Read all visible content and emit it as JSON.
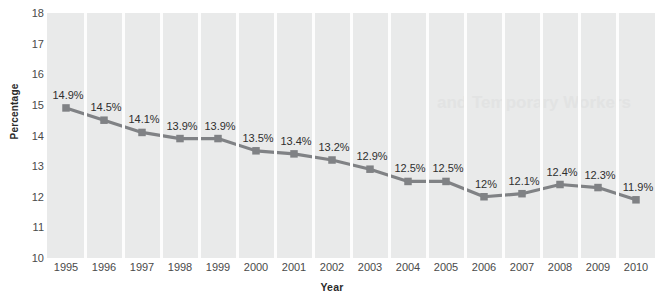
{
  "chart_data": {
    "type": "line",
    "title": "",
    "xlabel": "Year",
    "ylabel": "Percentage",
    "categories": [
      "1995",
      "1996",
      "1997",
      "1998",
      "1999",
      "2000",
      "2001",
      "2002",
      "2003",
      "2004",
      "2005",
      "2006",
      "2007",
      "2008",
      "2009",
      "2010"
    ],
    "values": [
      14.9,
      14.5,
      14.1,
      13.9,
      13.9,
      13.5,
      13.4,
      13.2,
      12.9,
      12.5,
      12.5,
      12.0,
      12.1,
      12.4,
      12.3,
      11.9
    ],
    "data_labels": [
      "14.9%",
      "14.5%",
      "14.1%",
      "13.9%",
      "13.9%",
      "13.5%",
      "13.4%",
      "13.2%",
      "12.9%",
      "12.5%",
      "12.5%",
      "12%",
      "12.1%",
      "12.4%",
      "12.3%",
      "11.9%"
    ],
    "ylim": [
      10,
      18
    ],
    "ytick_labels": [
      "18",
      "17",
      "16",
      "15",
      "14",
      "13",
      "12",
      "11",
      "10"
    ],
    "ytick_values": [
      18,
      17,
      16,
      15,
      14,
      13,
      12,
      11,
      10
    ],
    "grid": "vertical-band-separators",
    "legend": "none",
    "series_color": "#808285",
    "marker": "square",
    "plot_background": "#e9eaea",
    "gridline_color": "#fdfdfd"
  },
  "ghost": {
    "bleed_text": "and Temporary Workers"
  }
}
